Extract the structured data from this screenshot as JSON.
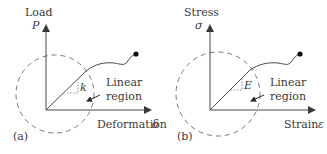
{
  "panels": [
    {
      "id": "a",
      "panel_label": "(a)",
      "y_axis_title": "Load",
      "y_axis_symbol": "P",
      "x_axis_title": "Deformation",
      "x_axis_symbol": "δ",
      "slope_symbol": "k",
      "region_label_line1": "Linear",
      "region_label_line2": "region"
    },
    {
      "id": "b",
      "panel_label": "(b)",
      "y_axis_title": "Stress",
      "y_axis_symbol": "σ",
      "x_axis_title": "Strain",
      "x_axis_symbol": "ε",
      "slope_symbol": "E",
      "region_label_line1": "Linear",
      "region_label_line2": "region"
    }
  ],
  "colors": {
    "line": "#4a4a4a",
    "dashed_circle": "#6a6a6a",
    "text": "#3a3a3a"
  }
}
